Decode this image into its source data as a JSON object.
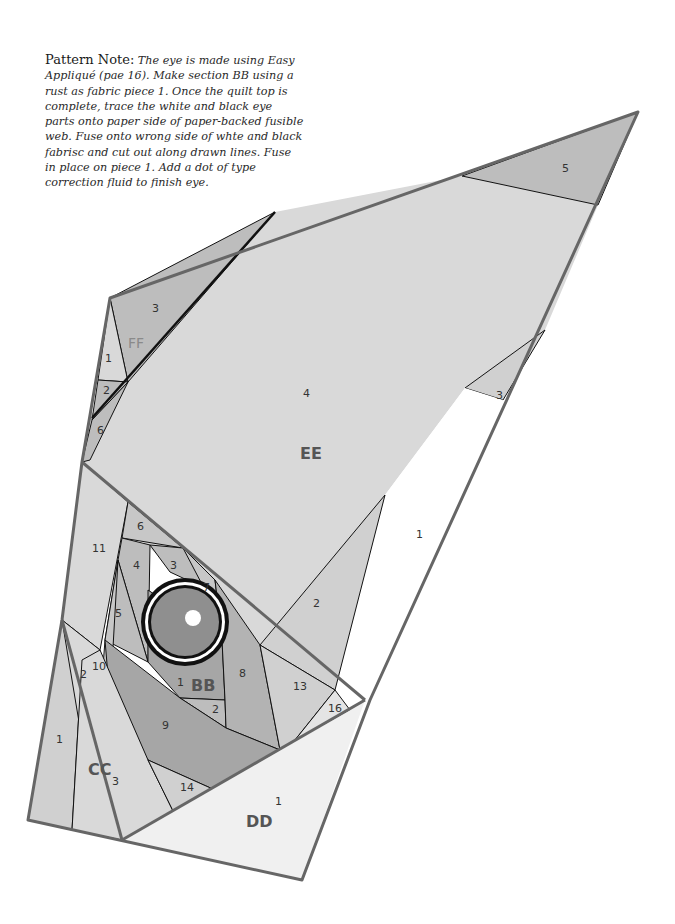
{
  "pattern_note": {
    "title": "Pattern Note:",
    "body": "The eye is made using Easy Appliqué (pae 16). Make section BB using a rust as fabric piece 1. Once the quilt top is complete, trace the white and black eye parts onto paper side of paper-backed fusible web. Fuse onto wrong side of whte and black fabrisc and cut out along drawn lines. Fuse in place on piece 1. Add a dot of type correction fluid to finish eye."
  },
  "colors": {
    "light": "#d9d9d9",
    "medium": "#bdbdbd",
    "dark": "#a6a6a6",
    "darker": "#8f8f8f",
    "white": "#ffffff",
    "outline": "#666666",
    "seam": "#111111"
  },
  "sections": {
    "ee": {
      "label": "EE",
      "pieces": [
        "1",
        "2",
        "3",
        "4",
        "5"
      ]
    },
    "ff": {
      "label": "FF",
      "pieces": [
        "1",
        "2",
        "3",
        "6",
        "12"
      ]
    },
    "bb": {
      "label": "BB",
      "pieces": [
        "1",
        "2",
        "3",
        "4",
        "5",
        "6",
        "7",
        "8",
        "9",
        "10",
        "11",
        "13",
        "16"
      ]
    },
    "cc": {
      "label": "CC",
      "pieces": [
        "1",
        "2",
        "3",
        "14"
      ]
    },
    "dd": {
      "label": "DD",
      "pieces": [
        "1"
      ]
    }
  },
  "labels": {
    "ee_5": "5",
    "ee_4": "4",
    "ee_3": "3",
    "ee_2": "2",
    "ee_1": "1",
    "ff_3": "3",
    "ff_1": "1",
    "ff_2": "2",
    "ff_6": "6",
    "ff_12": "12",
    "bb_6": "6",
    "bb_11": "11",
    "bb_4": "4",
    "bb_3": "3",
    "bb_7": "7",
    "bb_5": "5",
    "bb_10": "10",
    "bb_1": "1",
    "bb_8": "8",
    "bb_2": "2",
    "bb_9": "9",
    "bb_13": "13",
    "bb_16": "16",
    "cc_2": "2",
    "cc_1": "1",
    "cc_3": "3",
    "cc_14": "14",
    "dd_1": "1"
  }
}
